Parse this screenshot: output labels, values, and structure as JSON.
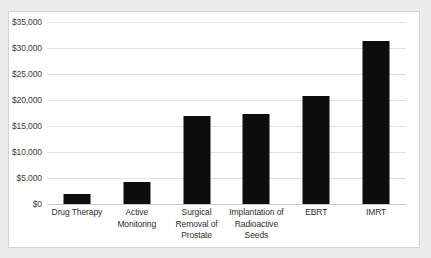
{
  "chart_data": {
    "type": "bar",
    "title": "",
    "xlabel": "",
    "ylabel": "",
    "categories": [
      "Drug Therapy",
      "Active Monitoring",
      "Surgical Removal of Prostate",
      "Implantation of Radioactive Seeds",
      "EBRT",
      "IMRT"
    ],
    "values": [
      2000,
      4200,
      16900,
      17400,
      20800,
      31400
    ],
    "ylim": [
      0,
      35000
    ],
    "ytick_values": [
      0,
      5000,
      10000,
      15000,
      20000,
      25000,
      30000,
      35000
    ],
    "ytick_labels": [
      "$0",
      "$5,000",
      "$10,000",
      "$15,000",
      "$20,000",
      "$25,000",
      "$30,000",
      "$35,000"
    ],
    "grid": true,
    "legend": false,
    "bar_color": "#0d0d0d",
    "gridline_color": "#e2e2e2",
    "axis_color": "#c9c9c9",
    "plot_background": "#ffffff",
    "page_background": "#ececec"
  }
}
